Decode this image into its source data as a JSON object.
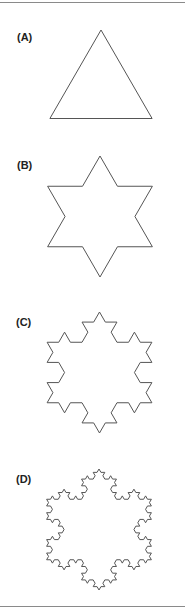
{
  "figure": {
    "stroke_color": "#555555",
    "panels": [
      {
        "label": "(A)",
        "iterations": 0,
        "center": [
          101,
          89
        ],
        "radius": 59,
        "label_pos": [
          17,
          32
        ]
      },
      {
        "label": "(B)",
        "iterations": 1,
        "center": [
          100,
          216.5
        ],
        "radius": 60.5,
        "label_pos": [
          17,
          160
        ]
      },
      {
        "label": "(C)",
        "iterations": 2,
        "center": [
          99.5,
          372.5
        ],
        "radius": 60.5,
        "label_pos": [
          16,
          317
        ]
      },
      {
        "label": "(D)",
        "iterations": 3,
        "center": [
          99,
          529.5
        ],
        "radius": 60.5,
        "label_pos": [
          16,
          474
        ]
      }
    ]
  }
}
